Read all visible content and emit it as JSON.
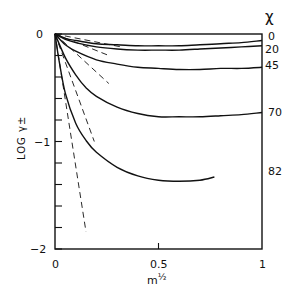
{
  "chart_data": {
    "type": "line",
    "title": "",
    "xlabel": "m^1/2",
    "ylabel": "LOG γ±",
    "xlim": [
      0,
      1
    ],
    "ylim": [
      -2,
      0
    ],
    "x_ticks": [
      "0",
      "0.5",
      "1"
    ],
    "y_ticks": [
      "0",
      "-1",
      "-2"
    ],
    "y_minor_tick_step": 0.2,
    "grid": false,
    "legend_title": "χ",
    "legend_position": "right, labels at curve ends",
    "series": [
      {
        "name": "0",
        "style": "solid",
        "x": [
          0,
          0.05,
          0.1,
          0.2,
          0.3,
          0.4,
          0.5,
          0.6,
          0.7,
          0.8,
          0.9,
          1.0
        ],
        "y": [
          0,
          -0.04,
          -0.06,
          -0.09,
          -0.1,
          -0.11,
          -0.11,
          -0.11,
          -0.1,
          -0.09,
          -0.08,
          -0.06
        ]
      },
      {
        "name": "20",
        "style": "solid",
        "x": [
          0,
          0.05,
          0.1,
          0.2,
          0.3,
          0.4,
          0.5,
          0.6,
          0.7,
          0.8,
          0.9,
          1.0
        ],
        "y": [
          0,
          -0.05,
          -0.08,
          -0.12,
          -0.14,
          -0.15,
          -0.15,
          -0.15,
          -0.14,
          -0.13,
          -0.12,
          -0.11
        ]
      },
      {
        "name": "45",
        "style": "solid",
        "x": [
          0,
          0.05,
          0.1,
          0.2,
          0.3,
          0.4,
          0.5,
          0.6,
          0.7,
          0.8,
          0.9,
          1.0
        ],
        "y": [
          0,
          -0.1,
          -0.16,
          -0.24,
          -0.28,
          -0.31,
          -0.32,
          -0.33,
          -0.33,
          -0.32,
          -0.32,
          -0.31
        ]
      },
      {
        "name": "70",
        "style": "solid",
        "x": [
          0,
          0.05,
          0.1,
          0.15,
          0.2,
          0.3,
          0.4,
          0.5,
          0.6,
          0.7,
          0.8,
          0.9,
          1.0
        ],
        "y": [
          0,
          -0.22,
          -0.38,
          -0.5,
          -0.58,
          -0.68,
          -0.74,
          -0.77,
          -0.77,
          -0.77,
          -0.76,
          -0.75,
          -0.73
        ]
      },
      {
        "name": "82",
        "style": "solid",
        "x": [
          0,
          0.02,
          0.05,
          0.1,
          0.15,
          0.2,
          0.3,
          0.4,
          0.5,
          0.6,
          0.7,
          0.77
        ],
        "y": [
          0,
          -0.25,
          -0.55,
          -0.83,
          -0.99,
          -1.1,
          -1.24,
          -1.32,
          -1.36,
          -1.37,
          -1.36,
          -1.33
        ]
      },
      {
        "name": "DH limit 1",
        "style": "dashed",
        "x": [
          0,
          0.32
        ],
        "y": [
          0,
          -0.12
        ]
      },
      {
        "name": "DH limit 2",
        "style": "dashed",
        "x": [
          0,
          0.26
        ],
        "y": [
          0,
          -0.2
        ]
      },
      {
        "name": "DH limit 3",
        "style": "dashed",
        "x": [
          0,
          0.26
        ],
        "y": [
          0,
          -0.46
        ]
      },
      {
        "name": "DH limit 4",
        "style": "dashed",
        "x": [
          0,
          0.19
        ],
        "y": [
          0,
          -1.0
        ]
      },
      {
        "name": "DH limit 5",
        "style": "dashed",
        "x": [
          0,
          0.15
        ],
        "y": [
          0,
          -1.84
        ]
      }
    ]
  },
  "labels": {
    "y0": "0",
    "y1": "−1",
    "y2": "−2",
    "x0": "0",
    "x05": "0.5",
    "x1": "1",
    "xlabel_base": "m",
    "xlabel_exp": "½",
    "ylabel": "LOG γ±",
    "legend_title": "χ",
    "series_labels": [
      "0",
      "20",
      "45",
      "70",
      "82"
    ]
  }
}
